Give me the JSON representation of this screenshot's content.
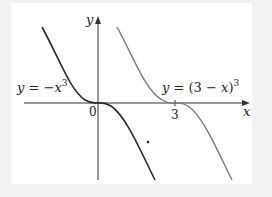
{
  "figure": {
    "axes": {
      "x_label": "x",
      "y_label": "y",
      "origin_label": "0",
      "tick_labels": [
        "3"
      ]
    },
    "curves": [
      {
        "name": "cubic-neg",
        "label_lhs": "y = ",
        "label_rhs": "−x",
        "label_exp": "3",
        "color": "#2a2a2a"
      },
      {
        "name": "cubic-shifted",
        "label_lhs": "y = ",
        "label_rhs": "(3 − x)",
        "label_exp": "3",
        "color": "#7a7a7a"
      }
    ]
  },
  "colors": {
    "background": "#f2f2f2",
    "panel": "#ffffff",
    "axis": "#333333"
  }
}
